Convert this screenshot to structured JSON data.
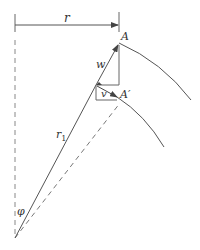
{
  "diagram": {
    "type": "vector-geometry",
    "colors": {
      "line": "#555555",
      "text": "#333333",
      "background": "#ffffff"
    },
    "labels": {
      "radius": "r",
      "point_a": "A",
      "point_a_prime": "A′",
      "velocity_w": "w",
      "velocity_v": "v",
      "radius_r1": "r",
      "radius_r1_sub": "1",
      "angle_phi": "φ"
    }
  }
}
